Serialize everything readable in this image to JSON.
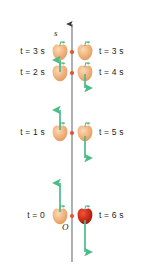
{
  "figure": {
    "axis": {
      "name": "s",
      "origin_label": "O",
      "direction": "up",
      "color": "#58595b"
    },
    "colors": {
      "apple_light": "#f0b27a",
      "apple_light_shade": "#e8a06a",
      "apple_red": "#cf2a1b",
      "apple_red_shade": "#9e1f10",
      "leaf_green": "#5fbf7f",
      "arrow_green": "#4cbb8a",
      "marker_dot": "#e8502a",
      "axis_gray": "#58595b",
      "text": "#231f20",
      "background": "#ffffff"
    },
    "left_labels": [
      {
        "text": "t = 3 s",
        "time_s": 3
      },
      {
        "text": "t = 2 s",
        "time_s": 2
      },
      {
        "text": "t = 1 s",
        "time_s": 1
      },
      {
        "text": "t = 0",
        "time_s": 0
      }
    ],
    "right_labels": [
      {
        "text": "t = 3 s",
        "time_s": 3
      },
      {
        "text": "t = 4 s",
        "time_s": 4
      },
      {
        "text": "t = 5 s",
        "time_s": 5
      },
      {
        "text": "t = 6 s",
        "time_s": 6
      }
    ],
    "apples": [
      {
        "id": "apple-t0",
        "side": "left",
        "time_s": 0,
        "color": "light",
        "arrow": "up",
        "arrow_length": "long"
      },
      {
        "id": "apple-t1",
        "side": "left",
        "time_s": 1,
        "color": "light",
        "arrow": "up",
        "arrow_length": "medium"
      },
      {
        "id": "apple-t2",
        "side": "left",
        "time_s": 2,
        "color": "light",
        "arrow": "up",
        "arrow_length": "short"
      },
      {
        "id": "apple-t3l",
        "side": "left",
        "time_s": 3,
        "color": "light",
        "arrow": "none",
        "arrow_length": "none"
      },
      {
        "id": "apple-t3r",
        "side": "right",
        "time_s": 3,
        "color": "light",
        "arrow": "none",
        "arrow_length": "none"
      },
      {
        "id": "apple-t4",
        "side": "right",
        "time_s": 4,
        "color": "light",
        "arrow": "down",
        "arrow_length": "short"
      },
      {
        "id": "apple-t5",
        "side": "right",
        "time_s": 5,
        "color": "light",
        "arrow": "down",
        "arrow_length": "medium"
      },
      {
        "id": "apple-t6",
        "side": "right",
        "time_s": 6,
        "color": "red",
        "arrow": "down",
        "arrow_length": "long"
      }
    ],
    "markers": [
      {
        "id": "marker-s3",
        "time_s": 3
      },
      {
        "id": "marker-s2",
        "time_s": 2
      },
      {
        "id": "marker-s1",
        "time_s": 1
      },
      {
        "id": "marker-s0",
        "time_s": 0
      }
    ]
  }
}
